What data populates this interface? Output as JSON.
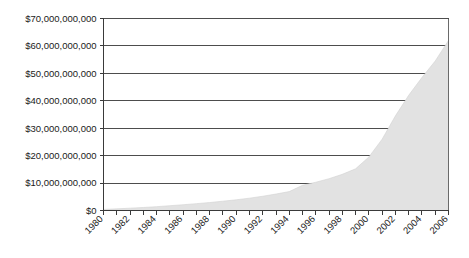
{
  "chart_data": {
    "type": "area",
    "title": "",
    "xlabel": "",
    "ylabel": "",
    "xlim": [
      1980,
      2006
    ],
    "ylim": [
      0,
      70000000000
    ],
    "grid": true,
    "legend": "none",
    "y_ticks": [
      0,
      10000000000,
      20000000000,
      30000000000,
      40000000000,
      50000000000,
      60000000000,
      70000000000
    ],
    "y_tick_labels": [
      "$0",
      "$10,000,000,000",
      "$20,000,000,000",
      "$30,000,000,000",
      "$40,000,000,000",
      "$50,000,000,000",
      "$60,000,000,000",
      "$70,000,000,000"
    ],
    "x_tick_labels": [
      "1980",
      "1982",
      "1984",
      "1986",
      "1988",
      "1990",
      "1992",
      "1994",
      "1996",
      "1998",
      "2000",
      "2002",
      "2004",
      "2006"
    ],
    "x_tick_label_rotation": -45,
    "x_minor_ticks_every": 1,
    "x": [
      1980,
      1981,
      1982,
      1983,
      1984,
      1985,
      1986,
      1987,
      1988,
      1989,
      1990,
      1991,
      1992,
      1993,
      1994,
      1995,
      1996,
      1997,
      1998,
      1999,
      2000,
      2001,
      2002,
      2003,
      2004,
      2005,
      2006
    ],
    "values": [
      400000000,
      600000000,
      850000000,
      1100000000,
      1400000000,
      1750000000,
      2100000000,
      2500000000,
      2900000000,
      3400000000,
      3900000000,
      4500000000,
      5200000000,
      6000000000,
      6900000000,
      9200000000,
      10300000000,
      11600000000,
      13200000000,
      15200000000,
      19500000000,
      26000000000,
      34500000000,
      42000000000,
      48500000000,
      54500000000,
      62000000000
    ],
    "series_name": "value",
    "fill_color": "#e2e2e2",
    "grid_color": "#4d4d4d",
    "axis_color": "#3a3a3a",
    "background": "#ffffff"
  }
}
